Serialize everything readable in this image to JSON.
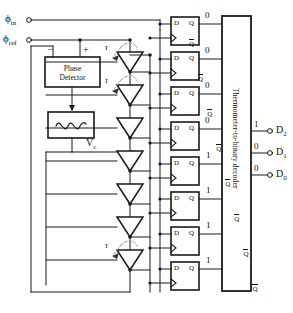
{
  "diagram": {
    "inputs": [
      {
        "name": "phi-in",
        "label": "ϕ",
        "sub": "in"
      },
      {
        "name": "phi-ref",
        "label": "ϕ",
        "sub": "ref"
      }
    ],
    "phase_detector": {
      "line1": "Phase",
      "line2": "Detector",
      "minus": "−",
      "plus": "+"
    },
    "loop_filter": {
      "icon": "vco-wave-icon"
    },
    "control_voltage": {
      "label": "V",
      "sub": "c"
    },
    "delay_line": {
      "stage_count": 7,
      "delay_label": "τ",
      "labeled_stages": [
        0,
        1,
        6
      ]
    },
    "flipflops": {
      "count": 8,
      "d_label": "D",
      "q_label": "Q",
      "qbar_label": "Q",
      "clock_marker": "clk-triangle-icon"
    },
    "thermometer_bits": [
      "0",
      "0",
      "0",
      "0",
      "1",
      "1",
      "1",
      "1"
    ],
    "decoder": {
      "label": "Thermometer-to-binary decoder"
    },
    "outputs": [
      {
        "name": "D2",
        "label": "D",
        "sub": "2",
        "value": "1"
      },
      {
        "name": "D1",
        "label": "D",
        "sub": "1",
        "value": "0"
      },
      {
        "name": "D0",
        "label": "D",
        "sub": "0",
        "value": "0"
      }
    ],
    "colors": {
      "line": "#1a1a1a",
      "background": "#ffffff",
      "dashed": "#888888"
    }
  }
}
